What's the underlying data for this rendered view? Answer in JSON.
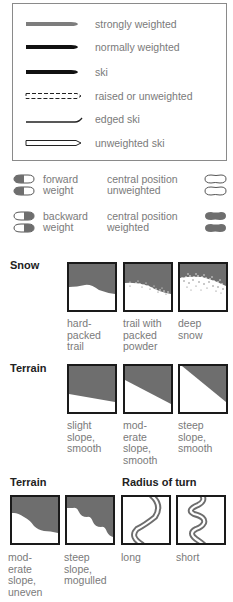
{
  "legend": {
    "items": [
      {
        "icon": "ski-strongly-weighted-icon",
        "label": "strongly weighted"
      },
      {
        "icon": "ski-normally-weighted-icon",
        "label": "normally weighted"
      },
      {
        "icon": "ski-icon",
        "label": "ski"
      },
      {
        "icon": "ski-raised-icon",
        "label": "raised or unweighted"
      },
      {
        "icon": "ski-edged-icon",
        "label": "edged ski"
      },
      {
        "icon": "ski-unweighted-icon",
        "label": "unweighted ski"
      }
    ]
  },
  "weight": {
    "forward": "forward\nweight",
    "backward": "backward\nweight",
    "central_unweighted": "central position\nunweighted",
    "central_weighted": "central position\nweighted"
  },
  "snow": {
    "heading": "Snow",
    "panels": [
      {
        "icon": "hard-packed-trail-icon",
        "caption": "hard-\npacked\ntrail"
      },
      {
        "icon": "packed-powder-icon",
        "caption": "trail with\npacked\npowder"
      },
      {
        "icon": "deep-snow-icon",
        "caption": "deep\nsnow"
      }
    ]
  },
  "terrain1": {
    "heading": "Terrain",
    "panels": [
      {
        "icon": "slight-slope-icon",
        "caption": "slight\nslope,\nsmooth"
      },
      {
        "icon": "moderate-slope-icon",
        "caption": "mod-\nerate\nslope,\nsmooth"
      },
      {
        "icon": "steep-slope-icon",
        "caption": "steep\nslope,\nsmooth"
      }
    ]
  },
  "terrain2": {
    "heading": "Terrain",
    "panels": [
      {
        "icon": "moderate-uneven-slope-icon",
        "caption": "mod-\nerate\nslope,\nuneven"
      },
      {
        "icon": "steep-mogulled-slope-icon",
        "caption": "steep\nslope,\nmogulled"
      }
    ]
  },
  "radius": {
    "heading": "Radius of turn",
    "panels": [
      {
        "icon": "long-radius-turn-icon",
        "caption": "long"
      },
      {
        "icon": "short-radius-turn-icon",
        "caption": "short"
      }
    ]
  },
  "colors": {
    "fill_gray": "#6e6e6e",
    "strong_gray": "#7d7d7d",
    "black": "#111111",
    "text_gray": "#7a7a7a"
  }
}
